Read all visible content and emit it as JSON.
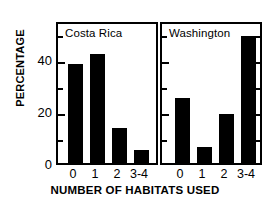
{
  "chart_data": {
    "type": "bar",
    "title": "",
    "xlabel": "NUMBER OF HABITATS USED",
    "ylabel": "PERCENTAGE",
    "categories": [
      "0",
      "1",
      "2",
      "3-4"
    ],
    "ylim": [
      0,
      55
    ],
    "yticks_major": [
      0,
      20,
      40
    ],
    "yticks_minor": [
      10,
      30,
      50
    ],
    "ytick_labels": [
      "0",
      "20",
      "40"
    ],
    "grid": false,
    "legend": "none",
    "bar_color": "#000000",
    "panels": [
      {
        "name": "costa-rica",
        "title": "Costa Rica",
        "categories": [
          "0",
          "1",
          "2",
          "3-4"
        ],
        "values": [
          38,
          42,
          13.5,
          5
        ]
      },
      {
        "name": "washington",
        "title": "Washington",
        "categories": [
          "0",
          "1",
          "2",
          "3-4"
        ],
        "values": [
          25,
          6,
          19,
          49
        ]
      }
    ]
  },
  "axis": {
    "ylabel": "PERCENTAGE",
    "xlabel": "NUMBER OF HABITATS USED",
    "ytick_labels": [
      "40",
      "20",
      "0"
    ]
  },
  "panels": {
    "costa_rica": {
      "title": "Costa Rica"
    },
    "washington": {
      "title": "Washington"
    }
  },
  "caption": ""
}
